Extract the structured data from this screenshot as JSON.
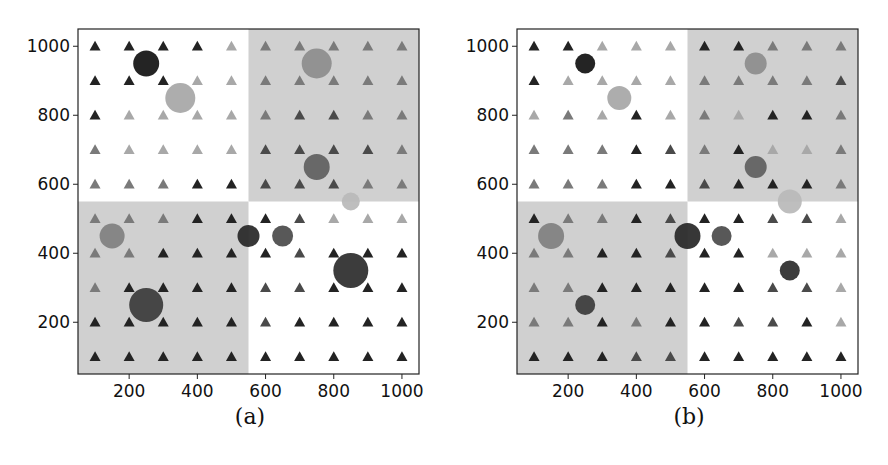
{
  "figure": {
    "panels": [
      {
        "id": "a",
        "caption": "(a)"
      },
      {
        "id": "b",
        "caption": "(b)"
      }
    ],
    "colors": {
      "shaded_region": "#d0d0d0",
      "frame": "#222222",
      "tri_dark": "#232323",
      "tri_middark": "#4a4a4a",
      "tri_mid": "#7a7a7a",
      "tri_light": "#a8a8a8",
      "text": "#111111"
    }
  },
  "chart_data": [
    {
      "type": "scatter",
      "title": "(a)",
      "xlabel": "",
      "ylabel": "",
      "xlim": [
        50,
        1050
      ],
      "ylim": [
        50,
        1050
      ],
      "xticks": [
        200,
        400,
        600,
        800,
        1000
      ],
      "yticks": [
        200,
        400,
        600,
        800,
        1000
      ],
      "grid": false,
      "shaded_regions": [
        {
          "x": [
            550,
            1050
          ],
          "y": [
            550,
            1050
          ]
        },
        {
          "x": [
            50,
            550
          ],
          "y": [
            50,
            550
          ]
        }
      ],
      "triangles": {
        "x": [
          100,
          200,
          300,
          400,
          500,
          600,
          700,
          800,
          900,
          1000
        ],
        "y": [
          1000,
          900,
          800,
          700,
          600,
          500,
          400,
          300,
          200,
          100
        ],
        "shade_levels_note": "0=light, 1=mid, 2=mid-dark, 3=dark",
        "shade_rows": [
          [
            3,
            3,
            3,
            3,
            0,
            1,
            1,
            1,
            1,
            1
          ],
          [
            3,
            3,
            3,
            0,
            0,
            1,
            1,
            1,
            1,
            1
          ],
          [
            3,
            0,
            0,
            0,
            0,
            1,
            2,
            2,
            1,
            1
          ],
          [
            1,
            0,
            0,
            0,
            0,
            2,
            2,
            2,
            2,
            1
          ],
          [
            1,
            1,
            1,
            3,
            3,
            2,
            2,
            2,
            1,
            1
          ],
          [
            1,
            1,
            1,
            3,
            3,
            3,
            2,
            0,
            0,
            0
          ],
          [
            1,
            1,
            3,
            3,
            3,
            3,
            2,
            3,
            3,
            3
          ],
          [
            1,
            3,
            3,
            3,
            3,
            2,
            2,
            3,
            3,
            3
          ],
          [
            3,
            3,
            3,
            3,
            3,
            2,
            3,
            3,
            3,
            3
          ],
          [
            3,
            3,
            3,
            3,
            3,
            3,
            3,
            3,
            3,
            3
          ]
        ]
      },
      "circles": [
        {
          "x": 250,
          "y": 950,
          "diameter_px": 26,
          "color": "#111111"
        },
        {
          "x": 350,
          "y": 850,
          "diameter_px": 30,
          "color": "#a6a6a6"
        },
        {
          "x": 750,
          "y": 950,
          "diameter_px": 30,
          "color": "#8c8c8c"
        },
        {
          "x": 750,
          "y": 650,
          "diameter_px": 26,
          "color": "#5e5e5e"
        },
        {
          "x": 850,
          "y": 550,
          "diameter_px": 18,
          "color": "#b8b8b8"
        },
        {
          "x": 150,
          "y": 450,
          "diameter_px": 25,
          "color": "#7f7f7f"
        },
        {
          "x": 550,
          "y": 450,
          "diameter_px": 22,
          "color": "#262626"
        },
        {
          "x": 650,
          "y": 450,
          "diameter_px": 21,
          "color": "#4a4a4a"
        },
        {
          "x": 850,
          "y": 350,
          "diameter_px": 35,
          "color": "#2b2b2b"
        },
        {
          "x": 250,
          "y": 250,
          "diameter_px": 34,
          "color": "#3a3a3a"
        }
      ]
    },
    {
      "type": "scatter",
      "title": "(b)",
      "xlabel": "",
      "ylabel": "",
      "xlim": [
        50,
        1050
      ],
      "ylim": [
        50,
        1050
      ],
      "xticks": [
        200,
        400,
        600,
        800,
        1000
      ],
      "yticks": [
        200,
        400,
        600,
        800,
        1000
      ],
      "grid": false,
      "shaded_regions": [
        {
          "x": [
            550,
            1050
          ],
          "y": [
            550,
            1050
          ]
        },
        {
          "x": [
            50,
            550
          ],
          "y": [
            50,
            550
          ]
        }
      ],
      "triangles": {
        "x": [
          100,
          200,
          300,
          400,
          500,
          600,
          700,
          800,
          900,
          1000
        ],
        "y": [
          1000,
          900,
          800,
          700,
          600,
          500,
          400,
          300,
          200,
          100
        ],
        "shade_levels_note": "0=light, 1=mid, 2=mid-dark, 3=dark",
        "shade_rows": [
          [
            3,
            3,
            0,
            0,
            0,
            3,
            3,
            1,
            1,
            1
          ],
          [
            3,
            0,
            0,
            0,
            0,
            1,
            1,
            1,
            1,
            2
          ],
          [
            0,
            1,
            0,
            3,
            0,
            1,
            0,
            3,
            3,
            1
          ],
          [
            1,
            1,
            1,
            3,
            2,
            1,
            3,
            0,
            0,
            1
          ],
          [
            1,
            1,
            1,
            3,
            3,
            2,
            3,
            3,
            3,
            1
          ],
          [
            3,
            1,
            1,
            3,
            2,
            3,
            3,
            2,
            2,
            0
          ],
          [
            1,
            1,
            3,
            3,
            2,
            3,
            3,
            0,
            0,
            0
          ],
          [
            1,
            1,
            3,
            3,
            3,
            3,
            3,
            2,
            2,
            0
          ],
          [
            1,
            1,
            3,
            1,
            3,
            3,
            2,
            2,
            3,
            0
          ],
          [
            3,
            3,
            3,
            2,
            2,
            3,
            3,
            3,
            3,
            3
          ]
        ]
      },
      "circles": [
        {
          "x": 250,
          "y": 950,
          "diameter_px": 20,
          "color": "#111111"
        },
        {
          "x": 350,
          "y": 850,
          "diameter_px": 24,
          "color": "#a6a6a6"
        },
        {
          "x": 750,
          "y": 950,
          "diameter_px": 22,
          "color": "#8c8c8c"
        },
        {
          "x": 750,
          "y": 650,
          "diameter_px": 22,
          "color": "#5e5e5e"
        },
        {
          "x": 850,
          "y": 550,
          "diameter_px": 24,
          "color": "#b8b8b8"
        },
        {
          "x": 150,
          "y": 450,
          "diameter_px": 26,
          "color": "#7f7f7f"
        },
        {
          "x": 550,
          "y": 450,
          "diameter_px": 26,
          "color": "#262626"
        },
        {
          "x": 650,
          "y": 450,
          "diameter_px": 20,
          "color": "#4a4a4a"
        },
        {
          "x": 850,
          "y": 350,
          "diameter_px": 20,
          "color": "#2b2b2b"
        },
        {
          "x": 250,
          "y": 250,
          "diameter_px": 20,
          "color": "#3a3a3a"
        }
      ]
    }
  ]
}
